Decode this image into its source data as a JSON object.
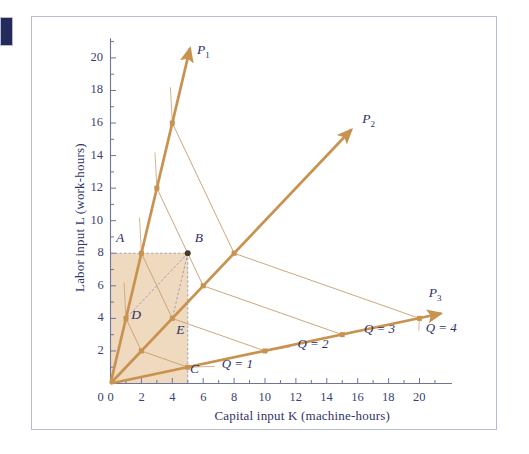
{
  "figure": {
    "background": "#ffffff",
    "frame_color": "#b6bcd2",
    "edge_tab_color": "#232a5c",
    "ray_color": "#c8924f",
    "isoquant_color": "#c9a277",
    "shade_color": "#efd9bf",
    "text_color": "#2c2f66"
  },
  "chart_data": {
    "type": "line",
    "title": "",
    "xlabel": "Capital input K (machine-hours)",
    "ylabel": "Labor input L (work-hours)",
    "xlim": [
      0,
      22
    ],
    "ylim": [
      0,
      21
    ],
    "xticks": [
      0,
      2,
      4,
      6,
      8,
      10,
      12,
      14,
      16,
      18,
      20
    ],
    "yticks": [
      0,
      2,
      4,
      6,
      8,
      10,
      12,
      14,
      16,
      18,
      20
    ],
    "xtick_labels": [
      "0",
      "2",
      "4",
      "6",
      "8",
      "10",
      "12",
      "14",
      "16",
      "18",
      "20"
    ],
    "ytick_labels": [
      "0",
      "2",
      "4",
      "6",
      "8",
      "10",
      "12",
      "14",
      "16",
      "18",
      "20"
    ],
    "grid": false,
    "legend": "none",
    "process_rays": [
      {
        "name": "P1",
        "label": "P",
        "subscript": "1",
        "slope": 4,
        "points": [
          [
            1,
            4
          ],
          [
            2,
            8
          ],
          [
            3,
            12
          ],
          [
            4,
            16
          ]
        ],
        "arrow_tip": [
          5.15,
          20.6
        ],
        "label_pos": [
          5.6,
          20.4
        ]
      },
      {
        "name": "P2",
        "label": "P",
        "subscript": "2",
        "slope": 1,
        "points": [
          [
            2,
            2
          ],
          [
            4,
            4
          ],
          [
            6,
            6
          ],
          [
            8,
            8
          ]
        ],
        "arrow_tip": [
          15.6,
          15.6
        ],
        "label_pos": [
          16.3,
          16.2
        ]
      },
      {
        "name": "P3",
        "label": "P",
        "subscript": "3",
        "slope": 0.2,
        "points": [
          [
            5,
            1
          ],
          [
            10,
            2
          ],
          [
            15,
            3
          ],
          [
            20,
            4
          ]
        ],
        "arrow_tip": [
          21.4,
          4.3
        ],
        "label_pos": [
          20.6,
          5.5
        ]
      }
    ],
    "isoquants": [
      {
        "label": "Q = 1",
        "q": 1,
        "points": [
          [
            1,
            4
          ],
          [
            2,
            2
          ],
          [
            5,
            1
          ]
        ],
        "label_pos": [
          7.2,
          1.15
        ]
      },
      {
        "label": "Q = 2",
        "q": 2,
        "points": [
          [
            2,
            8
          ],
          [
            4,
            4
          ],
          [
            10,
            2
          ]
        ],
        "label_pos": [
          12.1,
          2.35
        ]
      },
      {
        "label": "Q = 3",
        "q": 3,
        "points": [
          [
            3,
            12
          ],
          [
            6,
            6
          ],
          [
            15,
            3
          ]
        ],
        "label_pos": [
          16.4,
          3.3
        ]
      },
      {
        "label": "Q = 4",
        "q": 4,
        "points": [
          [
            4,
            16
          ],
          [
            8,
            8
          ],
          [
            20,
            4
          ]
        ],
        "label_pos": [
          20.4,
          3.35
        ]
      }
    ],
    "marked_points": [
      {
        "label": "A",
        "x": 0,
        "y": 8,
        "label_pos": [
          0.35,
          8.85
        ],
        "dot": false
      },
      {
        "label": "B",
        "x": 5,
        "y": 8,
        "label_pos": [
          5.45,
          8.85
        ],
        "dot": true
      },
      {
        "label": "C",
        "x": 5,
        "y": 0,
        "label_pos": [
          5.15,
          0.85
        ],
        "dot": false
      },
      {
        "label": "D",
        "x": 1,
        "y": 4,
        "label_pos": [
          1.35,
          4.15
        ],
        "dot": false
      },
      {
        "label": "E",
        "x": 4,
        "y": 4,
        "label_pos": [
          4.25,
          3.2
        ],
        "dot": false
      }
    ],
    "shaded_region": {
      "description": "rectangle 0,0 to 5,8",
      "x0": 0,
      "y0": 0,
      "x1": 5,
      "y1": 8
    },
    "dashed_connectors": [
      {
        "from": [
          0,
          8
        ],
        "to": [
          5,
          8
        ]
      },
      {
        "from": [
          5,
          8
        ],
        "to": [
          5,
          0
        ]
      },
      {
        "from": [
          5,
          8
        ],
        "to": [
          1,
          4
        ]
      },
      {
        "from": [
          5,
          8
        ],
        "to": [
          4,
          4
        ]
      }
    ]
  }
}
